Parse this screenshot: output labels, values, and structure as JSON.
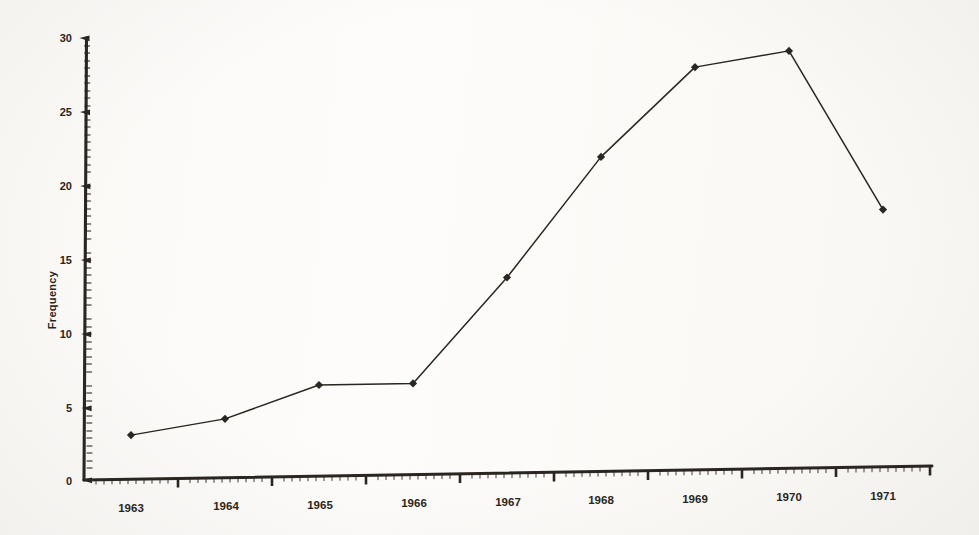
{
  "figure": {
    "background_color": "#fdfcfa",
    "ink_color": "#2b2520",
    "media": "scanned-paper-figure"
  },
  "chart_data": {
    "type": "line",
    "title": "",
    "subtitle": "",
    "xlabel": "",
    "ylabel": "Frequency",
    "categories": [
      "1963",
      "1964",
      "1965",
      "1966",
      "1967",
      "1968",
      "1969",
      "1970",
      "1971"
    ],
    "x": [
      1963,
      1964,
      1965,
      1966,
      1967,
      1968,
      1969,
      1970,
      1971
    ],
    "values": [
      3.0,
      4.0,
      6.2,
      6.2,
      13.3,
      21.4,
      27.4,
      28.4,
      17.5
    ],
    "series": [
      {
        "name": "Frequency",
        "values": [
          3.0,
          4.0,
          6.2,
          6.2,
          13.3,
          21.4,
          27.4,
          28.4,
          17.5
        ],
        "marker": "diamond",
        "line_color": "#2b2520",
        "marker_color": "#2b2520"
      }
    ],
    "ylim": [
      0,
      30
    ],
    "yticks": [
      0,
      5,
      10,
      15,
      20,
      25,
      30
    ],
    "ytick_labels": [
      "0",
      "5",
      "10",
      "15",
      "20",
      "25",
      "30"
    ],
    "xtick_labels": [
      "1963",
      "1964",
      "1965",
      "1966",
      "1967",
      "1968",
      "1969",
      "1970",
      "1971"
    ],
    "grid": false,
    "minor_ticks": true,
    "legend": false,
    "legend_position": "none"
  },
  "axes": {
    "y_axis_title": "Frequency",
    "y_tick_0": "0",
    "y_tick_5": "5",
    "y_tick_10": "10",
    "y_tick_15": "15",
    "y_tick_20": "20",
    "y_tick_25": "25",
    "y_tick_30": "30",
    "x_tick_1": "1963",
    "x_tick_2": "1964",
    "x_tick_3": "1965",
    "x_tick_4": "1966",
    "x_tick_5": "1967",
    "x_tick_6": "1968",
    "x_tick_7": "1969",
    "x_tick_8": "1970",
    "x_tick_9": "1971"
  }
}
